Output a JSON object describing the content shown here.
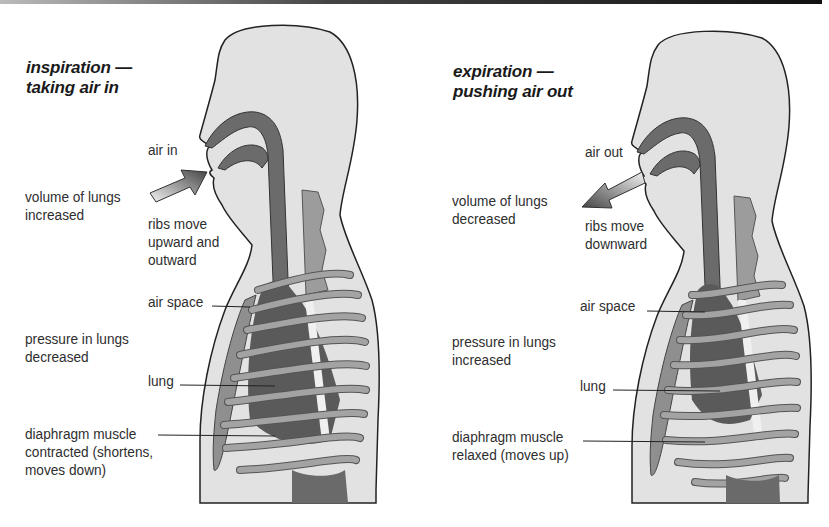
{
  "colors": {
    "skin": "#e2e2e2",
    "outline": "#222222",
    "airway": "#6b6b6b",
    "lung": "#5a5a5a",
    "rib": "#9a9a9a",
    "spine": "#7a7a7a",
    "text": "#2e2e2e"
  },
  "inspiration": {
    "title_line1": "inspiration —",
    "title_line2": "taking air in",
    "air_label": "air in",
    "volume_line1": "volume of lungs",
    "volume_line2": "increased",
    "ribs_line1": "ribs move",
    "ribs_line2": "upward and",
    "ribs_line3": "outward",
    "air_space": "air space",
    "pressure_line1": "pressure in lungs",
    "pressure_line2": "decreased",
    "lung": "lung",
    "diaphragm_line1": "diaphragm muscle",
    "diaphragm_line2": "contracted (shortens,",
    "diaphragm_line3": "moves down)",
    "arrow_direction": "into mouth"
  },
  "expiration": {
    "title_line1": "expiration —",
    "title_line2": "pushing air out",
    "air_label": "air out",
    "volume_line1": "volume of lungs",
    "volume_line2": "decreased",
    "ribs_line1": "ribs move",
    "ribs_line2": "downward",
    "air_space": "air space",
    "pressure_line1": "pressure in lungs",
    "pressure_line2": "increased",
    "lung": "lung",
    "diaphragm_line1": "diaphragm muscle",
    "diaphragm_line2": "relaxed (moves up)",
    "arrow_direction": "out of mouth"
  }
}
